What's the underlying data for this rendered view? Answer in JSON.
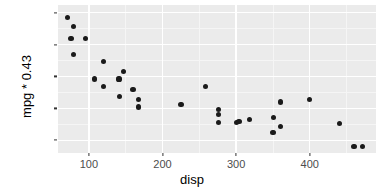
{
  "chart_data": {
    "type": "scatter",
    "title": "",
    "xlabel": "disp",
    "ylabel": "mpg * 0.43",
    "xlim": [
      58,
      490
    ],
    "ylim": [
      4.0,
      15.6
    ],
    "grid": true,
    "legend": "none",
    "point_color": "#1a1a1a",
    "panel_background": "#ebebeb",
    "gridline_color": "#ffffff",
    "xticks": [
      100,
      200,
      300,
      400
    ],
    "xtick_labels": [
      "100",
      "200",
      "300",
      "400"
    ],
    "yticks": [
      5.0,
      7.5,
      10.0,
      12.5,
      15.0
    ],
    "ytick_labels": [
      "5.0",
      "7.5",
      "10.0",
      "12.5",
      "15.0"
    ],
    "x_minor_ticks": [
      150,
      250,
      350,
      450
    ],
    "y_minor_ticks": [
      6.25,
      8.75,
      11.25,
      13.75
    ],
    "points": [
      {
        "x": 71.1,
        "y": 14.6
      },
      {
        "x": 78.7,
        "y": 13.9
      },
      {
        "x": 75.7,
        "y": 13.0
      },
      {
        "x": 95.1,
        "y": 13.0
      },
      {
        "x": 79.0,
        "y": 11.7
      },
      {
        "x": 120.3,
        "y": 11.2
      },
      {
        "x": 108.0,
        "y": 9.8
      },
      {
        "x": 140.8,
        "y": 9.8
      },
      {
        "x": 120.1,
        "y": 9.2
      },
      {
        "x": 146.7,
        "y": 10.4
      },
      {
        "x": 141.0,
        "y": 8.4
      },
      {
        "x": 160.0,
        "y": 9.0
      },
      {
        "x": 167.6,
        "y": 8.2
      },
      {
        "x": 167.6,
        "y": 7.6
      },
      {
        "x": 225.0,
        "y": 7.8
      },
      {
        "x": 258.0,
        "y": 9.2
      },
      {
        "x": 275.8,
        "y": 7.4
      },
      {
        "x": 275.8,
        "y": 7.0
      },
      {
        "x": 275.8,
        "y": 6.4
      },
      {
        "x": 301.0,
        "y": 6.4
      },
      {
        "x": 304.0,
        "y": 6.5
      },
      {
        "x": 318.0,
        "y": 6.6
      },
      {
        "x": 350.0,
        "y": 5.6
      },
      {
        "x": 351.0,
        "y": 6.8
      },
      {
        "x": 360.0,
        "y": 8.0
      },
      {
        "x": 360.0,
        "y": 6.1
      },
      {
        "x": 400.0,
        "y": 8.2
      },
      {
        "x": 440.0,
        "y": 6.3
      },
      {
        "x": 460.0,
        "y": 4.5
      },
      {
        "x": 472.0,
        "y": 4.5
      }
    ]
  }
}
